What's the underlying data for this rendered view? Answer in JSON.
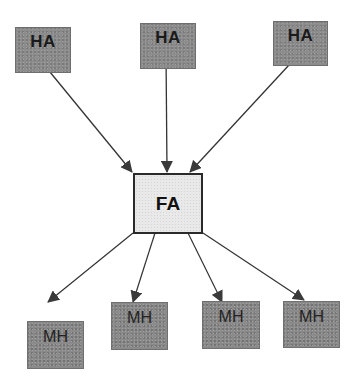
{
  "diagram": {
    "top_nodes": [
      {
        "label": "HA"
      },
      {
        "label": "HA"
      },
      {
        "label": "HA"
      }
    ],
    "center_node": {
      "label": "FA"
    },
    "bottom_nodes": [
      {
        "label": "MH"
      },
      {
        "label": "MH"
      },
      {
        "label": "MH"
      },
      {
        "label": "MH"
      }
    ],
    "edges": [
      {
        "from": "HA-1",
        "to": "FA"
      },
      {
        "from": "HA-2",
        "to": "FA"
      },
      {
        "from": "HA-3",
        "to": "FA"
      },
      {
        "from": "FA",
        "to": "MH-1"
      },
      {
        "from": "FA",
        "to": "MH-2"
      },
      {
        "from": "FA",
        "to": "MH-3"
      },
      {
        "from": "FA",
        "to": "MH-4"
      }
    ],
    "colors": {
      "ha_fill": "#8c8c8c",
      "fa_fill": "#e9e9e9",
      "mh_fill": "#8a8a8a",
      "edge": "#333333"
    }
  }
}
